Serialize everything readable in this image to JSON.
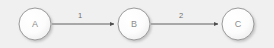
{
  "diagram": {
    "type": "directed-graph",
    "title": "",
    "background_color": "#f0f0f0",
    "node_fill_color": "#fbfbfb",
    "node_stroke_color": "#9a9a9a",
    "node_text_color": "#8d8d8d",
    "edge_color": "#555555",
    "edge_label_color": "#6e6e6e",
    "nodes": [
      {
        "id": "A",
        "label": "A",
        "cx": 35,
        "cy": 24,
        "r": 16
      },
      {
        "id": "B",
        "label": "B",
        "cx": 134,
        "cy": 24,
        "r": 16
      },
      {
        "id": "C",
        "label": "C",
        "cx": 238,
        "cy": 24,
        "r": 16
      }
    ],
    "edges": [
      {
        "from": "A",
        "to": "B",
        "label": "1",
        "x1": 52,
        "y1": 24,
        "x2": 115,
        "y2": 24,
        "label_x": 80,
        "label_y": 18
      },
      {
        "from": "B",
        "to": "C",
        "label": "2",
        "x1": 151,
        "y1": 24,
        "x2": 219,
        "y2": 24,
        "label_x": 181,
        "label_y": 18
      }
    ]
  }
}
